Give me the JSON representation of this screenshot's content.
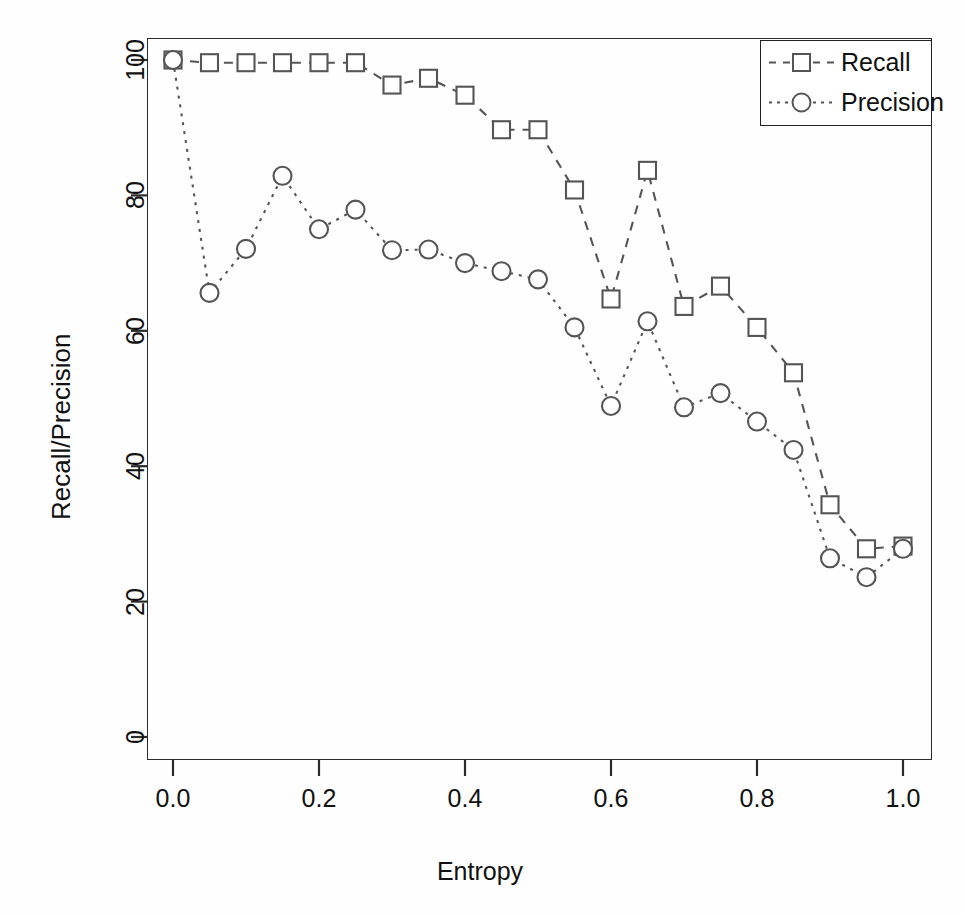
{
  "chart_data": {
    "type": "line",
    "title": "",
    "xlabel": "Entropy",
    "ylabel": "Recall/Precision",
    "xlim": [
      -0.02,
      1.02
    ],
    "ylim": [
      0,
      104
    ],
    "xticks": [
      "0.0",
      "0.2",
      "0.4",
      "0.6",
      "0.8",
      "1.0"
    ],
    "xtick_values": [
      0.0,
      0.2,
      0.4,
      0.6,
      0.8,
      1.0
    ],
    "yticks": [
      "0",
      "20",
      "40",
      "60",
      "80",
      "100"
    ],
    "ytick_values": [
      0,
      20,
      40,
      60,
      80,
      100
    ],
    "grid": false,
    "legend_position": "top-right",
    "x": [
      0.0,
      0.05,
      0.1,
      0.15,
      0.2,
      0.25,
      0.3,
      0.35,
      0.4,
      0.45,
      0.5,
      0.55,
      0.6,
      0.65,
      0.7,
      0.75,
      0.8,
      0.85,
      0.9,
      0.95,
      1.0
    ],
    "series": [
      {
        "name": "Recall",
        "marker": "square",
        "linestyle": "dashed",
        "color": "#555555",
        "values": [
          100.0,
          99.6,
          99.6,
          99.6,
          99.6,
          99.6,
          96.3,
          97.3,
          94.8,
          89.7,
          89.7,
          80.8,
          64.7,
          83.7,
          63.6,
          66.6,
          60.5,
          53.8,
          34.3,
          27.8,
          28.2
        ]
      },
      {
        "name": "Precision",
        "marker": "circle",
        "linestyle": "dotted",
        "color": "#555555",
        "values": [
          100.0,
          65.6,
          72.1,
          82.9,
          75.0,
          77.9,
          71.9,
          72.0,
          70.0,
          68.8,
          67.6,
          60.5,
          48.9,
          61.4,
          48.7,
          50.8,
          46.6,
          42.4,
          26.4,
          23.6,
          27.8
        ]
      }
    ]
  },
  "legend": {
    "items": [
      {
        "label": "Recall",
        "marker": "square"
      },
      {
        "label": "Precision",
        "marker": "circle"
      }
    ]
  },
  "axes": {
    "x_title": "Entropy",
    "y_title": "Recall/Precision"
  }
}
